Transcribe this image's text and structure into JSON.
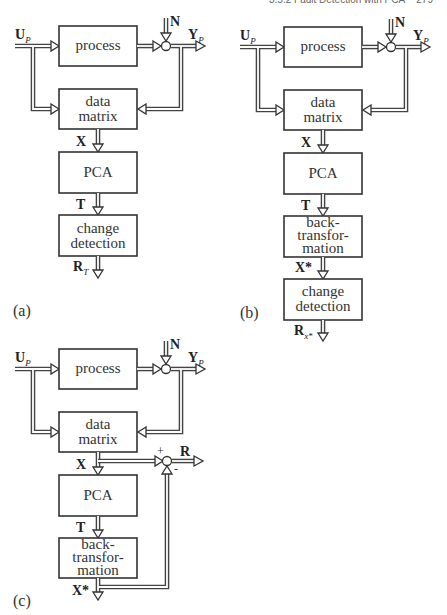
{
  "page_header": {
    "section": "3.5.2 Fault Detection with PCA",
    "page": "279"
  },
  "signals": {
    "input": "U",
    "input_sub": "P",
    "output": "Y",
    "output_sub": "P",
    "noise": "N",
    "data": "X",
    "scores": "T",
    "reconstructed": "X*",
    "residual_T": "R",
    "residual_T_sub": "T",
    "residual_X": "R",
    "residual_X_sub": "x*",
    "residual": "R"
  },
  "blocks": {
    "process": "process",
    "data_matrix": "data\nmatrix",
    "pca": "PCA",
    "change_detection": "change\ndetection",
    "back_transformation": "back-\ntransfor-\nmation"
  },
  "summing_signs": {
    "plus": "+",
    "minus": "-"
  },
  "panels": {
    "a": {
      "label": "(a)",
      "chain": [
        "process",
        "data matrix",
        "PCA",
        "change detection"
      ],
      "output": "R_T"
    },
    "b": {
      "label": "(b)",
      "chain": [
        "process",
        "data matrix",
        "PCA",
        "back-transformation",
        "change detection"
      ],
      "output": "R_x*"
    },
    "c": {
      "label": "(c)",
      "chain": [
        "process",
        "data matrix",
        "PCA",
        "back-transformation"
      ],
      "output": "R = X - X*"
    }
  }
}
